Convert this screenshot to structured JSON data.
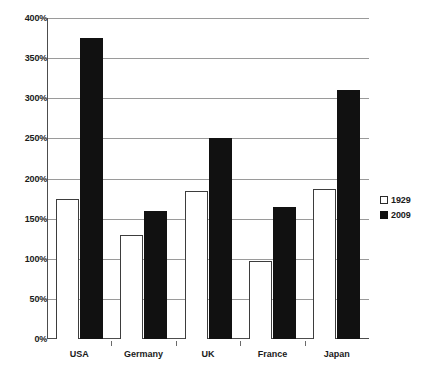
{
  "chart_data": {
    "type": "bar",
    "title": "",
    "subtitle": "",
    "xlabel": "",
    "ylabel": "",
    "categories": [
      "USA",
      "Germany",
      "UK",
      "France",
      "Japan"
    ],
    "series": [
      {
        "name": "1929",
        "color": "#ffffff",
        "values": [
          175,
          130,
          185,
          97,
          187
        ]
      },
      {
        "name": "2009",
        "color": "#111111",
        "values": [
          375,
          160,
          250,
          165,
          310
        ]
      }
    ],
    "ylim": [
      0,
      400
    ],
    "ytick_step": 50,
    "ytick_labels": [
      "0%",
      "50%",
      "100%",
      "150%",
      "200%",
      "250%",
      "300%",
      "350%",
      "400%"
    ],
    "ytick_values": [
      0,
      50,
      100,
      150,
      200,
      250,
      300,
      350,
      400
    ],
    "value_suffix": "%",
    "grid": true,
    "grid_axis": "y",
    "legend_position": "right",
    "legend_entries": [
      "1929",
      "2009"
    ]
  }
}
